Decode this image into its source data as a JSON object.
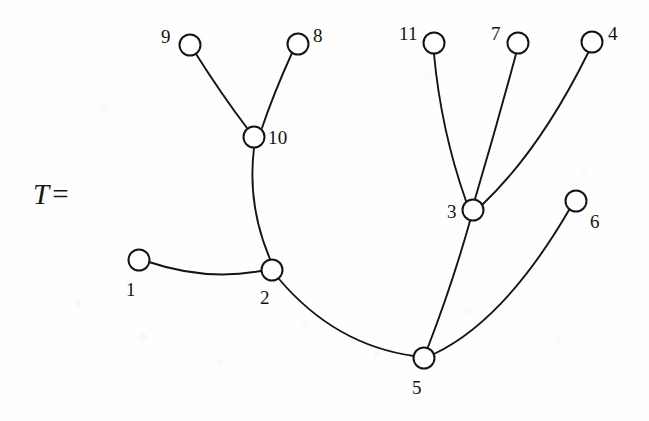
{
  "figure": {
    "title": "T",
    "equation_prefix": "T",
    "equation_sign": "=",
    "equation_full": "T =",
    "canvas": {
      "width": 649,
      "height": 421
    },
    "background_color": "#fefefe",
    "stroke_color": "#141414",
    "node_fill_color": "#ffffff",
    "label_color": "#14120f"
  },
  "graph": {
    "type": "tree",
    "node_radius": 10.5,
    "node_count": 11,
    "edge_count": 10,
    "nodes": [
      {
        "id": "1",
        "label": "1",
        "x": 139,
        "y": 260,
        "label_x": 126,
        "label_y": 280,
        "label_anchor": "below-left"
      },
      {
        "id": "2",
        "label": "2",
        "x": 272,
        "y": 270,
        "label_x": 260,
        "label_y": 288,
        "label_anchor": "below-left"
      },
      {
        "id": "3",
        "label": "3",
        "x": 473,
        "y": 210,
        "label_x": 447,
        "label_y": 202,
        "label_anchor": "left"
      },
      {
        "id": "4",
        "label": "4",
        "x": 592,
        "y": 42,
        "label_x": 608,
        "label_y": 24,
        "label_anchor": "upper-right"
      },
      {
        "id": "5",
        "label": "5",
        "x": 424,
        "y": 358,
        "label_x": 412,
        "label_y": 378,
        "label_anchor": "below"
      },
      {
        "id": "6",
        "label": "6",
        "x": 576,
        "y": 201,
        "label_x": 590,
        "label_y": 212,
        "label_anchor": "lower-right"
      },
      {
        "id": "7",
        "label": "7",
        "x": 518,
        "y": 43,
        "label_x": 491,
        "label_y": 24,
        "label_anchor": "upper-left"
      },
      {
        "id": "8",
        "label": "8",
        "x": 298,
        "y": 44,
        "label_x": 313,
        "label_y": 26,
        "label_anchor": "upper-right"
      },
      {
        "id": "9",
        "label": "9",
        "x": 190,
        "y": 45,
        "label_x": 161,
        "label_y": 27,
        "label_anchor": "upper-left"
      },
      {
        "id": "10",
        "label": "10",
        "x": 254,
        "y": 137,
        "label_x": 268,
        "label_y": 128,
        "label_anchor": "right"
      },
      {
        "id": "11",
        "label": "11",
        "x": 434,
        "y": 43,
        "label_x": 399,
        "label_y": 24,
        "label_anchor": "upper-left"
      }
    ],
    "edges": [
      {
        "from": "9",
        "to": "10",
        "path": "M 196 54 Q 222 95 247 128",
        "curve": "slight"
      },
      {
        "from": "8",
        "to": "10",
        "path": "M 292 53 Q 273 95 262 128",
        "curve": "slight"
      },
      {
        "from": "10",
        "to": "2",
        "path": "M 254 148 Q 247 205 270 259",
        "curve": "bow-left"
      },
      {
        "from": "1",
        "to": "2",
        "path": "M 149 262 Q 205 281 261 271",
        "curve": "bow-down"
      },
      {
        "from": "2",
        "to": "5",
        "path": "M 279 279 Q 335 345 414 356",
        "curve": "bow-down"
      },
      {
        "from": "5",
        "to": "3",
        "path": "M 428 347 Q 452 285 470 221",
        "curve": "slight"
      },
      {
        "from": "5",
        "to": "6",
        "path": "M 434 354 Q 505 320 569 210",
        "curve": "bow-down-right"
      },
      {
        "from": "3",
        "to": "11",
        "path": "M 466 201 Q 441 130 434 54",
        "curve": "bow-left"
      },
      {
        "from": "3",
        "to": "7",
        "path": "M 475 199 Q 497 125 516 54",
        "curve": "slight"
      },
      {
        "from": "3",
        "to": "4",
        "path": "M 482 205 Q 540 150 588 53",
        "curve": "bow-right"
      }
    ]
  }
}
